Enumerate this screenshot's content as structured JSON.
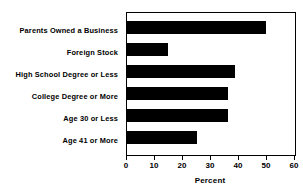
{
  "chart_data": {
    "type": "bar",
    "orientation": "horizontal",
    "title": "",
    "xlabel": "Percent",
    "ylabel": "",
    "xlim": [
      0,
      60
    ],
    "xticks": [
      0,
      10,
      20,
      30,
      40,
      50,
      60
    ],
    "grid": false,
    "legend": null,
    "bar_color": "#000000",
    "background_color": "#ffffff",
    "categories": [
      "Parents Owned a Business",
      "Foreign Stock",
      "High School Degree or Less",
      "College Degree or More",
      "Age 30 or Less",
      "Age 41 or More"
    ],
    "values": [
      49.5,
      14.5,
      38.5,
      36,
      36,
      25
    ]
  }
}
